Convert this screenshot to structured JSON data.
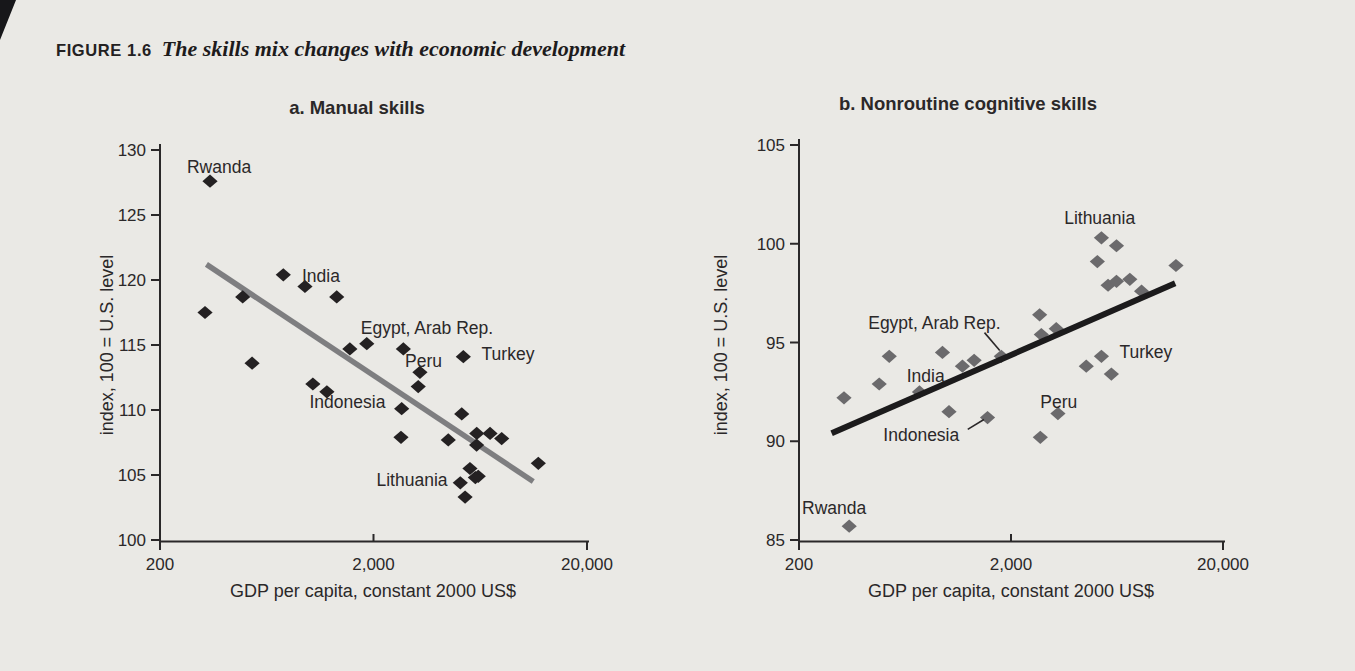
{
  "page": {
    "background": "#eae9e5",
    "artifact_color": "#17171a"
  },
  "heading": {
    "label": "FIGURE 1.6",
    "title": "The skills mix changes with economic development"
  },
  "chart_data": [
    {
      "id": "a",
      "type": "scatter",
      "title": "a. Manual skills",
      "xlabel": "GDP per capita, constant 2000 US$",
      "ylabel": "index, 100 = U.S. level",
      "x_scale": "log",
      "xlim": [
        200,
        20000
      ],
      "ylim": [
        100,
        130
      ],
      "x_ticks": [
        {
          "value": 200,
          "label": "200"
        },
        {
          "value": 2000,
          "label": "2,000"
        },
        {
          "value": 20000,
          "label": "20,000"
        }
      ],
      "y_ticks": [
        100,
        105,
        110,
        115,
        120,
        125,
        130
      ],
      "marker_color": "#242122",
      "trend": {
        "x1": 330,
        "y1": 121.2,
        "x2": 11200,
        "y2": 104.5,
        "color": "#7e7e80",
        "width": 5.5,
        "z": "under"
      },
      "points": [
        [
          343,
          127.6
        ],
        [
          325,
          117.5
        ],
        [
          488,
          118.7
        ],
        [
          756,
          120.4
        ],
        [
          955,
          119.5
        ],
        [
          1345,
          118.7
        ],
        [
          540,
          113.6
        ],
        [
          1040,
          112.0
        ],
        [
          1210,
          111.4
        ],
        [
          1550,
          114.7
        ],
        [
          1860,
          115.1
        ],
        [
          2760,
          114.7
        ],
        [
          5270,
          114.1
        ],
        [
          3300,
          112.9
        ],
        [
          3240,
          111.8
        ],
        [
          2710,
          110.1
        ],
        [
          2690,
          107.9
        ],
        [
          4480,
          107.7
        ],
        [
          5180,
          109.7
        ],
        [
          6090,
          108.2
        ],
        [
          7030,
          108.2
        ],
        [
          7970,
          107.8
        ],
        [
          6080,
          107.3
        ],
        [
          11830,
          105.9
        ],
        [
          5660,
          105.5
        ],
        [
          6190,
          104.9
        ],
        [
          5100,
          104.4
        ],
        [
          6000,
          104.8
        ],
        [
          5370,
          103.3
        ]
      ],
      "annotations": [
        {
          "text": "Rwanda",
          "x": 378,
          "y": 128.7
        },
        {
          "text": "India",
          "x": 1135,
          "y": 120.3
        },
        {
          "text": "Egypt, Arab Rep.",
          "x": 3560,
          "y": 116.3
        },
        {
          "text": "Peru",
          "x": 3430,
          "y": 113.8
        },
        {
          "text": "Turkey",
          "x": 8530,
          "y": 114.3
        },
        {
          "text": "Indonesia",
          "x": 1510,
          "y": 110.6
        },
        {
          "text": "Lithuania",
          "x": 3030,
          "y": 104.6
        }
      ],
      "leaders": []
    },
    {
      "id": "b",
      "type": "scatter",
      "title": "b. Nonroutine cognitive skills",
      "xlabel": "GDP per capita, constant 2000 US$",
      "ylabel": "index, 100 = U.S. level",
      "x_scale": "log",
      "xlim": [
        200,
        20000
      ],
      "ylim": [
        85,
        105
      ],
      "x_ticks": [
        {
          "value": 200,
          "label": "200"
        },
        {
          "value": 2000,
          "label": "2,000"
        },
        {
          "value": 20000,
          "label": "20,000"
        }
      ],
      "y_ticks": [
        85,
        90,
        95,
        100,
        105
      ],
      "marker_color": "#6b6a6c",
      "trend": {
        "x1": 285,
        "y1": 90.4,
        "x2": 11900,
        "y2": 98.0,
        "color": "#1c1b1c",
        "width": 6,
        "z": "over"
      },
      "points": [
        [
          345,
          85.7
        ],
        [
          326,
          92.2
        ],
        [
          478,
          92.9
        ],
        [
          533,
          94.3
        ],
        [
          740,
          92.5
        ],
        [
          950,
          94.5
        ],
        [
          1180,
          93.8
        ],
        [
          1340,
          94.1
        ],
        [
          1020,
          91.5
        ],
        [
          1550,
          91.2
        ],
        [
          1800,
          94.3
        ],
        [
          2730,
          96.4
        ],
        [
          2780,
          95.4
        ],
        [
          3270,
          95.7
        ],
        [
          3330,
          91.4
        ],
        [
          2750,
          90.2
        ],
        [
          4530,
          93.8
        ],
        [
          5340,
          94.3
        ],
        [
          5950,
          93.4
        ],
        [
          5110,
          99.1
        ],
        [
          5340,
          100.3
        ],
        [
          6290,
          99.9
        ],
        [
          5740,
          97.9
        ],
        [
          6290,
          98.1
        ],
        [
          7270,
          98.2
        ],
        [
          8260,
          97.6
        ],
        [
          12000,
          98.9
        ]
      ],
      "annotations": [
        {
          "text": "Rwanda",
          "x": 293,
          "y": 86.6
        },
        {
          "text": "India",
          "x": 792,
          "y": 93.3
        },
        {
          "text": "Egypt, Arab Rep.",
          "x": 870,
          "y": 96.0
        },
        {
          "text": "Indonesia",
          "x": 755,
          "y": 90.3
        },
        {
          "text": "Peru",
          "x": 3360,
          "y": 92.0
        },
        {
          "text": "Turkey",
          "x": 8650,
          "y": 94.5
        },
        {
          "text": "Lithuania",
          "x": 5240,
          "y": 101.3
        }
      ],
      "leaders": [
        {
          "x1": 1500,
          "y1": 95.5,
          "x2": 1770,
          "y2": 94.6
        },
        {
          "x1": 1250,
          "y1": 90.6,
          "x2": 1490,
          "y2": 91.1
        }
      ]
    }
  ]
}
